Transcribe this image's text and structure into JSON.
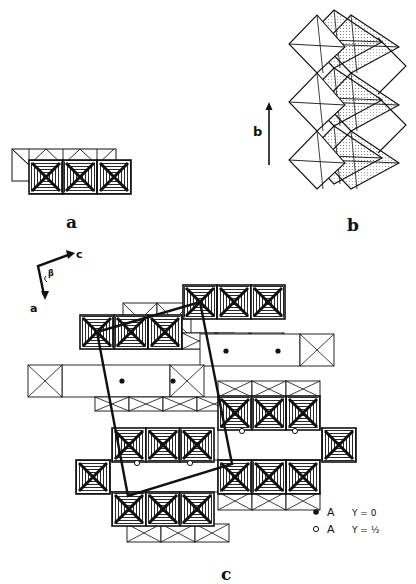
{
  "figure": {
    "panels": [
      {
        "id": "a",
        "caption": "a",
        "description": "Edge-sharing octahedral chains, top view"
      },
      {
        "id": "b",
        "caption": "b",
        "axis_label": "b",
        "description": "Zig-zag octahedral chain along b"
      },
      {
        "id": "c",
        "caption": "c",
        "axis_labels": {
          "c": "c",
          "a": "a",
          "beta": "β"
        },
        "description": "Projection of structure with unit cell outline"
      }
    ],
    "legend": [
      {
        "symbol": "filled-circle",
        "label": "A",
        "value": "Y = 0"
      },
      {
        "symbol": "open-circle",
        "label": "A",
        "value": "Y = ½"
      }
    ],
    "colors": {
      "ink": "#111111",
      "background": "#ffffff",
      "stipple": "#555555"
    }
  }
}
